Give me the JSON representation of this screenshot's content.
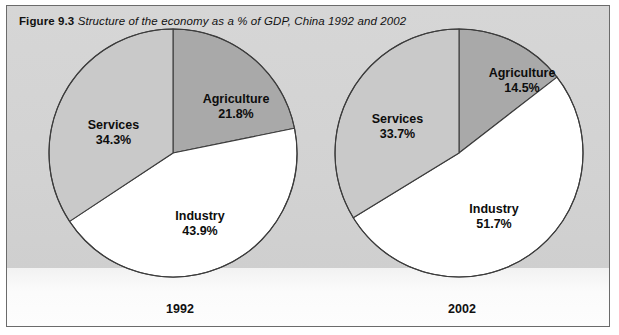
{
  "figure": {
    "number": "Figure 9.3",
    "caption": "Structure of the economy as a % of GDP, China 1992 and 2002"
  },
  "colors": {
    "panel_background": "#d4d4d4",
    "frame_border": "#6b6b6b",
    "slice_dark_gray": "#a9a9a9",
    "slice_light_gray": "#c9c9c9",
    "slice_white": "#ffffff",
    "slice_outline": "#3c3c3c",
    "text": "#0d0d0d",
    "bottom_strip": "#fbfbfb"
  },
  "chart_data": [
    {
      "type": "pie",
      "title": "1992",
      "categories": [
        "Agriculture",
        "Industry",
        "Services"
      ],
      "values": [
        21.8,
        43.9,
        34.3
      ],
      "labels": [
        "21.8%",
        "43.9%",
        "34.3%"
      ],
      "colors": [
        "#a9a9a9",
        "#ffffff",
        "#c9c9c9"
      ],
      "start_angle_deg": 0,
      "direction": "clockwise",
      "legend": "none",
      "units": "% of GDP"
    },
    {
      "type": "pie",
      "title": "2002",
      "categories": [
        "Agriculture",
        "Industry",
        "Services"
      ],
      "values": [
        14.5,
        51.7,
        33.7
      ],
      "labels": [
        "14.5%",
        "51.7%",
        "33.7%"
      ],
      "colors": [
        "#a9a9a9",
        "#ffffff",
        "#c9c9c9"
      ],
      "start_angle_deg": 0,
      "direction": "clockwise",
      "legend": "none",
      "units": "% of GDP"
    }
  ],
  "charts": [
    {
      "id": "1992",
      "year_label": "1992",
      "slices": [
        {
          "name": "Agriculture",
          "label": "Agriculture",
          "percent": "21.8%"
        },
        {
          "name": "Industry",
          "label": "Industry",
          "percent": "43.9%"
        },
        {
          "name": "Services",
          "label": "Services",
          "percent": "34.3%"
        }
      ]
    },
    {
      "id": "2002",
      "year_label": "2002",
      "slices": [
        {
          "name": "Agriculture",
          "label": "Agriculture",
          "percent": "14.5%"
        },
        {
          "name": "Industry",
          "label": "Industry",
          "percent": "51.7%"
        },
        {
          "name": "Services",
          "label": "Services",
          "percent": "33.7%"
        }
      ]
    }
  ]
}
